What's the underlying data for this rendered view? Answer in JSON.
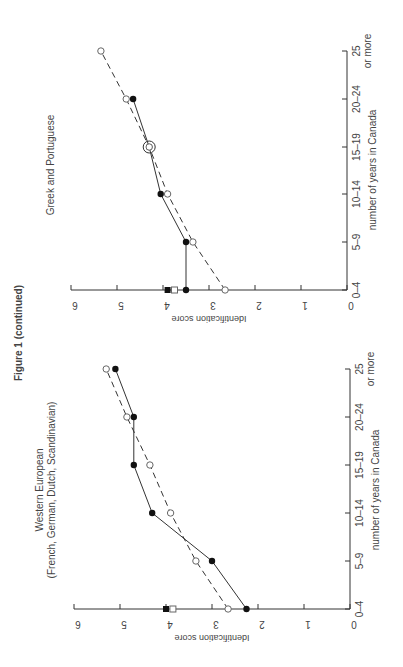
{
  "figure": {
    "caption": "Figure 1 (continued)"
  },
  "colors": {
    "ink": "#333333",
    "background": "#ffffff"
  },
  "chart_data": [
    {
      "type": "line",
      "title": "Greek and Portuguese",
      "subtitle": "",
      "xlabel": "number of years in Canada",
      "ylabel": "Identification score",
      "categories": [
        "0–4",
        "5–9",
        "10–14",
        "15–19",
        "20–24",
        "25 or more"
      ],
      "ylim": [
        0,
        6
      ],
      "yticks": [
        0,
        1,
        2,
        3,
        4,
        5,
        6
      ],
      "grid": false,
      "legend": "none",
      "orientation": "rotated 90° (page turned)",
      "series": [
        {
          "name": "filled circles (solid line)",
          "marker": "filled-circle",
          "line": "solid",
          "values": [
            3.5,
            3.5,
            4.05,
            4.3,
            4.65,
            null
          ]
        },
        {
          "name": "open circles (dashed line)",
          "marker": "open-circle",
          "line": "dashed",
          "values": [
            2.65,
            3.35,
            3.9,
            4.3,
            4.8,
            5.35
          ]
        }
      ],
      "reference_markers": [
        {
          "name": "filled square",
          "marker": "filled-square",
          "value": 3.9
        },
        {
          "name": "open square",
          "marker": "open-square",
          "value": 3.75
        }
      ],
      "annotations": [
        "15–19 point circled (both series coincide)"
      ]
    },
    {
      "type": "line",
      "title": "Western European",
      "subtitle": "(French, German, Dutch, Scandinavian)",
      "xlabel": "number of years in Canada",
      "ylabel": "Identification score",
      "categories": [
        "0–4",
        "5–9",
        "10–14",
        "15–19",
        "20–24",
        "25 or more"
      ],
      "ylim": [
        0,
        6
      ],
      "yticks": [
        0,
        1,
        2,
        3,
        4,
        5,
        6
      ],
      "grid": false,
      "legend": "none",
      "orientation": "rotated 90° (page turned)",
      "series": [
        {
          "name": "filled circles (solid line)",
          "marker": "filled-circle",
          "line": "solid",
          "values": [
            2.25,
            3.0,
            4.3,
            4.7,
            4.7,
            5.1
          ]
        },
        {
          "name": "open circles (dashed line)",
          "marker": "open-circle",
          "line": "dashed",
          "values": [
            2.65,
            3.35,
            3.9,
            4.35,
            4.85,
            5.3
          ]
        }
      ],
      "reference_markers": [
        {
          "name": "filled square",
          "marker": "filled-square",
          "value": 4.0
        },
        {
          "name": "open square",
          "marker": "open-square",
          "value": 3.85
        }
      ],
      "annotations": []
    }
  ],
  "layout": {
    "panels": [
      {
        "zeroX": 347,
        "unitPx": 46,
        "catY": [
          290,
          242,
          194,
          147,
          99,
          51
        ],
        "axisTopX": 71,
        "titleX": 54,
        "titleCenterY": 165,
        "xlabelX": 376,
        "xlabelCenterY": 170,
        "captionX": 0
      },
      {
        "zeroX": 350,
        "unitPx": 46,
        "catY": [
          609,
          561,
          513,
          465,
          417,
          369
        ],
        "axisTopX": 74,
        "titleX": 43,
        "titleCenterY": 490,
        "xlabelX": 379,
        "xlabelCenterY": 490
      }
    ]
  }
}
